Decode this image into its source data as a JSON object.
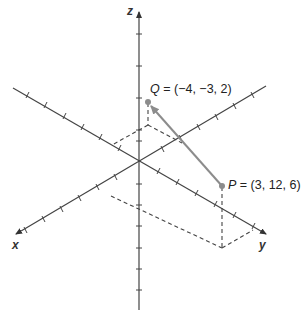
{
  "diagram": {
    "axes": {
      "x_label": "x",
      "y_label": "y",
      "z_label": "z"
    },
    "points": {
      "Q": {
        "name": "Q",
        "coords": "(−4, −3, 2)",
        "label_sep": " = "
      },
      "P": {
        "name": "P",
        "coords": "(3, 12, 6)",
        "label_sep": " = "
      }
    },
    "vector": {
      "from": "P",
      "to": "Q"
    },
    "colors": {
      "axis": "#444444",
      "vector": "#8c8c8c",
      "point": "#8c8c8c",
      "dash": "#444444"
    }
  }
}
